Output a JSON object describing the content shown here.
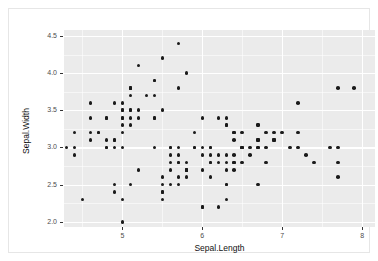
{
  "chart_data": {
    "type": "scatter",
    "title": "",
    "subtitle": "",
    "xlabel": "Sepal.Length",
    "ylabel": "Sepal.Width",
    "xlim": [
      4.27,
      8.16
    ],
    "ylim": [
      1.93,
      4.58
    ],
    "x_ticks": [
      5,
      6,
      7,
      8
    ],
    "x_tick_labels": [
      "5",
      "6",
      "7",
      "8"
    ],
    "y_ticks": [
      2.0,
      2.5,
      3.0,
      3.5,
      4.0,
      4.5
    ],
    "y_tick_labels": [
      "2.0",
      "2.5",
      "3.0",
      "3.5",
      "4.0",
      "4.5"
    ],
    "x_minor_ticks": [
      4.5,
      5.5,
      6.5,
      7.5
    ],
    "y_minor_ticks": [
      2.25,
      2.75,
      3.25,
      3.75,
      4.25
    ],
    "grid": true,
    "legend": "none",
    "point_color": "#1a1a1a",
    "panel_color": "#ebebeb",
    "grid_color": "#ffffff",
    "point_count": 150,
    "points": [
      [
        5.1,
        3.5
      ],
      [
        4.9,
        3.0
      ],
      [
        4.7,
        3.2
      ],
      [
        4.6,
        3.1
      ],
      [
        5.0,
        3.6
      ],
      [
        5.4,
        3.9
      ],
      [
        4.6,
        3.4
      ],
      [
        5.0,
        3.4
      ],
      [
        4.4,
        2.9
      ],
      [
        4.9,
        3.1
      ],
      [
        5.4,
        3.7
      ],
      [
        4.8,
        3.4
      ],
      [
        4.8,
        3.0
      ],
      [
        4.3,
        3.0
      ],
      [
        5.8,
        4.0
      ],
      [
        5.7,
        4.4
      ],
      [
        5.4,
        3.9
      ],
      [
        5.1,
        3.5
      ],
      [
        5.7,
        3.8
      ],
      [
        5.1,
        3.8
      ],
      [
        5.4,
        3.4
      ],
      [
        5.1,
        3.7
      ],
      [
        4.6,
        3.6
      ],
      [
        5.1,
        3.3
      ],
      [
        4.8,
        3.4
      ],
      [
        5.0,
        3.0
      ],
      [
        5.0,
        3.4
      ],
      [
        5.2,
        3.5
      ],
      [
        5.2,
        3.4
      ],
      [
        4.7,
        3.2
      ],
      [
        4.8,
        3.1
      ],
      [
        5.4,
        3.4
      ],
      [
        5.2,
        4.1
      ],
      [
        5.5,
        4.2
      ],
      [
        4.9,
        3.1
      ],
      [
        5.0,
        3.2
      ],
      [
        5.5,
        3.5
      ],
      [
        4.9,
        3.6
      ],
      [
        4.4,
        3.0
      ],
      [
        5.1,
        3.4
      ],
      [
        5.0,
        3.5
      ],
      [
        4.5,
        2.3
      ],
      [
        4.4,
        3.2
      ],
      [
        5.0,
        3.5
      ],
      [
        5.1,
        3.8
      ],
      [
        4.8,
        3.0
      ],
      [
        5.1,
        3.8
      ],
      [
        4.6,
        3.2
      ],
      [
        5.3,
        3.7
      ],
      [
        5.0,
        3.3
      ],
      [
        7.0,
        3.2
      ],
      [
        6.4,
        3.2
      ],
      [
        6.9,
        3.1
      ],
      [
        5.5,
        2.3
      ],
      [
        6.5,
        2.8
      ],
      [
        5.7,
        2.8
      ],
      [
        6.3,
        3.3
      ],
      [
        4.9,
        2.4
      ],
      [
        6.6,
        2.9
      ],
      [
        5.2,
        2.7
      ],
      [
        5.0,
        2.0
      ],
      [
        5.9,
        3.0
      ],
      [
        6.0,
        2.2
      ],
      [
        6.1,
        2.9
      ],
      [
        5.6,
        2.9
      ],
      [
        6.7,
        3.1
      ],
      [
        5.6,
        3.0
      ],
      [
        5.8,
        2.7
      ],
      [
        6.2,
        2.2
      ],
      [
        5.6,
        2.5
      ],
      [
        5.9,
        3.2
      ],
      [
        6.1,
        2.8
      ],
      [
        6.3,
        2.5
      ],
      [
        6.1,
        2.8
      ],
      [
        6.4,
        2.9
      ],
      [
        6.6,
        3.0
      ],
      [
        6.8,
        2.8
      ],
      [
        6.7,
        3.0
      ],
      [
        6.0,
        2.9
      ],
      [
        5.7,
        2.6
      ],
      [
        5.5,
        2.4
      ],
      [
        5.5,
        2.4
      ],
      [
        5.8,
        2.7
      ],
      [
        6.0,
        2.7
      ],
      [
        5.4,
        3.0
      ],
      [
        6.0,
        3.4
      ],
      [
        6.7,
        3.1
      ],
      [
        6.3,
        2.3
      ],
      [
        5.6,
        3.0
      ],
      [
        5.5,
        2.5
      ],
      [
        5.5,
        2.6
      ],
      [
        6.1,
        3.0
      ],
      [
        5.8,
        2.6
      ],
      [
        5.0,
        2.3
      ],
      [
        5.6,
        2.7
      ],
      [
        5.7,
        3.0
      ],
      [
        5.7,
        2.9
      ],
      [
        6.2,
        2.9
      ],
      [
        5.1,
        2.5
      ],
      [
        5.7,
        2.8
      ],
      [
        6.3,
        3.3
      ],
      [
        5.8,
        2.7
      ],
      [
        7.1,
        3.0
      ],
      [
        6.3,
        2.9
      ],
      [
        6.5,
        3.0
      ],
      [
        7.6,
        3.0
      ],
      [
        4.9,
        2.5
      ],
      [
        7.3,
        2.9
      ],
      [
        6.7,
        2.5
      ],
      [
        7.2,
        3.6
      ],
      [
        6.5,
        3.2
      ],
      [
        6.4,
        2.7
      ],
      [
        6.8,
        3.0
      ],
      [
        5.7,
        2.5
      ],
      [
        5.8,
        2.8
      ],
      [
        6.4,
        3.2
      ],
      [
        6.5,
        3.0
      ],
      [
        7.7,
        3.8
      ],
      [
        7.7,
        2.6
      ],
      [
        6.0,
        2.2
      ],
      [
        6.9,
        3.2
      ],
      [
        5.6,
        2.8
      ],
      [
        7.7,
        2.8
      ],
      [
        6.3,
        2.7
      ],
      [
        6.7,
        3.3
      ],
      [
        7.2,
        3.2
      ],
      [
        6.2,
        2.8
      ],
      [
        6.1,
        3.0
      ],
      [
        6.4,
        2.8
      ],
      [
        7.2,
        3.0
      ],
      [
        7.4,
        2.8
      ],
      [
        7.9,
        3.8
      ],
      [
        6.4,
        2.8
      ],
      [
        6.3,
        2.8
      ],
      [
        6.1,
        2.6
      ],
      [
        7.7,
        3.0
      ],
      [
        6.3,
        3.4
      ],
      [
        6.4,
        3.1
      ],
      [
        6.0,
        3.0
      ],
      [
        6.9,
        3.1
      ],
      [
        6.7,
        3.1
      ],
      [
        6.9,
        3.1
      ],
      [
        5.8,
        2.7
      ],
      [
        6.8,
        3.2
      ],
      [
        6.7,
        3.3
      ],
      [
        6.7,
        3.0
      ],
      [
        6.3,
        2.5
      ],
      [
        6.5,
        3.0
      ],
      [
        6.2,
        3.4
      ],
      [
        5.9,
        3.0
      ]
    ]
  }
}
